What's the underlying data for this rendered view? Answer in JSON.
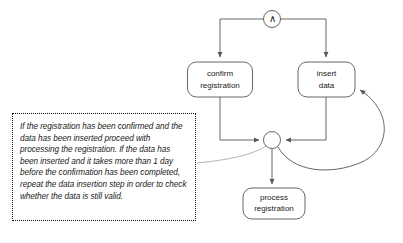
{
  "diagram": {
    "type": "process-flow",
    "nodes": [
      {
        "id": "and-gate",
        "kind": "and-junction",
        "glyph": "∧",
        "label": "AND"
      },
      {
        "id": "confirm-registration",
        "kind": "task",
        "line1": "confirm",
        "line2": "registration"
      },
      {
        "id": "insert-data",
        "kind": "task",
        "line1": "insert",
        "line2": "data"
      },
      {
        "id": "sync-junction",
        "kind": "circle-junction",
        "glyph": ""
      },
      {
        "id": "process-registration",
        "kind": "task",
        "line1": "process",
        "line2": "registration"
      }
    ],
    "edges": [
      {
        "from": "and-gate",
        "to": "confirm-registration",
        "style": "orthogonal"
      },
      {
        "from": "and-gate",
        "to": "insert-data",
        "style": "orthogonal"
      },
      {
        "from": "confirm-registration",
        "to": "sync-junction",
        "style": "orthogonal"
      },
      {
        "from": "insert-data",
        "to": "sync-junction",
        "style": "orthogonal"
      },
      {
        "from": "sync-junction",
        "to": "process-registration",
        "style": "straight"
      },
      {
        "from": "sync-junction",
        "to": "insert-data",
        "style": "curved-loop"
      },
      {
        "from": "annotation",
        "to": "sync-junction",
        "style": "curved-leader"
      }
    ],
    "annotation": {
      "text": "If the registration has been confirmed and the data has been inserted proceed with processing the registration. If the data has been inserted and it takes more than 1 day before the confirmation has been completed, repeat the data insertion step in order to check whether the data is still valid.",
      "border_style": "dotted"
    },
    "colors": {
      "stroke": "#555555",
      "text": "#1a1a1a",
      "background": "#ffffff",
      "annotation_border": "#111111",
      "leader_line": "#aaaaaa"
    }
  }
}
